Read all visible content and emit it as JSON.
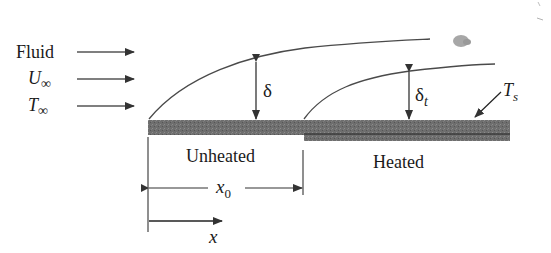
{
  "diagram": {
    "type": "boundary-layer-unheated-starting-length",
    "inlet": {
      "labels": [
        {
          "id": "fluid",
          "text": "Fluid",
          "italic": false
        },
        {
          "id": "u_inf",
          "text": "U",
          "sub": "∞",
          "italic": true
        },
        {
          "id": "t_inf",
          "text": "T",
          "sub": "∞",
          "italic": true
        }
      ]
    },
    "layers": {
      "velocity": {
        "symbol": "δ",
        "sub": ""
      },
      "thermal": {
        "symbol": "δ",
        "sub": "t"
      }
    },
    "surface": {
      "symbol": "T",
      "sub": "s"
    },
    "plate": {
      "unheated_label": "Unheated",
      "heated_label": "Heated"
    },
    "dimensions": {
      "x0": {
        "symbol": "x",
        "sub": "0"
      },
      "x": {
        "symbol": "x"
      }
    },
    "colors": {
      "ink": "#1a1a1a",
      "line": "#4a4a4a",
      "plate": "#6e6e6e",
      "plate_dark": "#3c3c3c",
      "smudge": "#8a8a8a"
    }
  }
}
